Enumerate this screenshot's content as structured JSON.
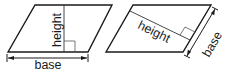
{
  "diagram": {
    "left_figure": {
      "height_label": "height",
      "base_label": "base"
    },
    "right_figure": {
      "height_label": "height",
      "base_label": "base"
    },
    "colors": {
      "stroke": "#1a1a1a",
      "thin_stroke": "#555555",
      "background": "#ffffff"
    }
  }
}
